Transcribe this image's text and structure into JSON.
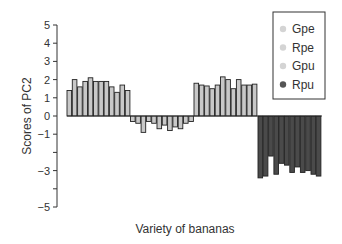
{
  "chart_data": {
    "type": "bar",
    "title": "",
    "xlabel": "Variety of bananas",
    "ylabel": "Scores of PC2",
    "ylim": [
      -5,
      5
    ],
    "yticks": [
      5,
      4,
      3,
      2,
      1,
      0,
      -1,
      -2,
      -3,
      -4,
      -5
    ],
    "ytick_labels": [
      "5",
      "4",
      "3",
      "2",
      "1",
      "0",
      "−1",
      "",
      "−3",
      "",
      "−5"
    ],
    "grid": false,
    "legend_position": "upper right",
    "series": [
      {
        "name": "Gpe",
        "color": "#c8c8c8",
        "legend_marker_color": "#d4d4d4",
        "values": [
          1.4,
          2.0,
          1.6,
          1.9,
          2.1,
          1.9,
          1.9,
          1.9,
          1.6,
          1.3,
          1.7,
          1.4
        ]
      },
      {
        "name": "Rpe",
        "color": "#c8c8c8",
        "legend_marker_color": "#d4d4d4",
        "values": [
          -0.3,
          -0.4,
          -0.9,
          -0.3,
          -0.4,
          -0.7,
          -0.5,
          -0.8,
          -0.6,
          -0.7,
          -0.4,
          -0.3
        ]
      },
      {
        "name": "Gpu",
        "color": "#c8c8c8",
        "legend_marker_color": "#d4d4d4",
        "values": [
          1.8,
          1.7,
          1.65,
          1.5,
          1.7,
          2.15,
          2.0,
          1.5,
          2.0,
          1.7,
          1.7,
          1.75
        ]
      },
      {
        "name": "Rpu",
        "color": "#4a4a4a",
        "legend_marker_color": "#555555",
        "values": [
          -3.4,
          -3.3,
          -2.2,
          -3.2,
          -2.6,
          -2.7,
          -3.1,
          -2.8,
          -3.1,
          -3.0,
          -3.2,
          -3.3
        ]
      }
    ]
  }
}
